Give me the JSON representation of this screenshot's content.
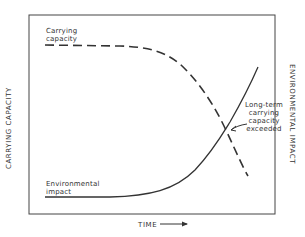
{
  "diagram": {
    "axes": {
      "x_label": "TIME",
      "y_left_label": "CARRYING CAPACITY",
      "y_right_label": "ENVIRONMENTAL IMPACT"
    },
    "curves": [
      {
        "name": "Carrying capacity",
        "style": "dashed",
        "trend": "flat then declining",
        "label_line1": "Carrying",
        "label_line2": "capacity"
      },
      {
        "name": "Environmental impact",
        "style": "solid",
        "trend": "flat then rising exponentially",
        "label_line1": "Environmental",
        "label_line2": "impact"
      }
    ],
    "annotation": {
      "line1": "Long-term",
      "line2": "carrying",
      "line3": "capacity",
      "line4": "exceeded"
    },
    "colors": {
      "line": "#333333",
      "background": "#ffffff"
    }
  }
}
